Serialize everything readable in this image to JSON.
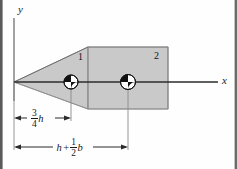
{
  "figure": {
    "background_color": "#fefefe",
    "fill_color": "#c8c8c8",
    "line_color": "#1a1a1a",
    "border_color": "#4a4a4a"
  },
  "axes": {
    "y_label": "y",
    "x_label": "x",
    "origin_x": 14,
    "origin_y": 82
  },
  "shapes": [
    {
      "id": "1",
      "kind": "triangle",
      "label": "1",
      "label_x": 78,
      "label_y": 53,
      "points": "14,82 88,47 88,109",
      "centroid_x": 71,
      "centroid_y": 82
    },
    {
      "id": "2",
      "kind": "rectangle",
      "label": "2",
      "label_x": 154,
      "label_y": 52,
      "x": 88,
      "y": 47,
      "width": 80,
      "height": 62,
      "centroid_x": 128,
      "centroid_y": 82
    }
  ],
  "dimensions": [
    {
      "id": "dim-three-quarter-h",
      "text": "3/4 h",
      "numerator": "3",
      "denominator": "4",
      "variable": "h",
      "from_x": 14,
      "to_x": 71,
      "line_y": 118,
      "label_x": 30,
      "label_y": 110
    },
    {
      "id": "dim-h-plus-half-b",
      "text": "h + 1/2 b",
      "first_variable": "h",
      "operator": "+",
      "numerator": "1",
      "denominator": "2",
      "second_variable": "b",
      "from_x": 14,
      "to_x": 128,
      "line_y": 147,
      "label_x": 55,
      "label_y": 140
    }
  ],
  "centroid_markers": [
    {
      "name": "centroid-marker-1",
      "cx": 71,
      "cy": 82,
      "r": 7
    },
    {
      "name": "centroid-marker-2",
      "cx": 128,
      "cy": 82,
      "r": 7.5
    }
  ]
}
